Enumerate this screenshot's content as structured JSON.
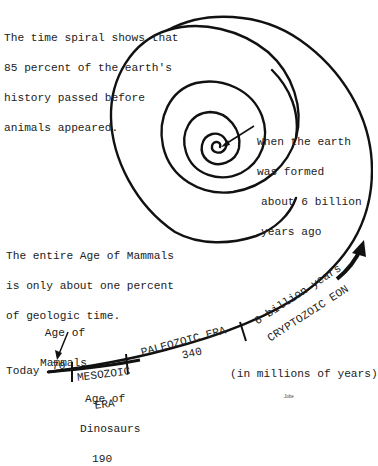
{
  "diagram": {
    "intro_text": [
      "The time spiral shows that",
      "85 percent of the earth's",
      "history passed before",
      "animals appeared."
    ],
    "origin_callout": [
      "When the earth",
      "was formed",
      "about 6 billion",
      "years ago"
    ],
    "mammal_note": [
      "The entire Age of Mammals",
      "is only about one percent",
      "of geologic time."
    ],
    "age_of_mammals_label": [
      "Age of",
      "Mammals"
    ],
    "today_label": "Today",
    "units_label": "(in millions of years)",
    "signature": "Jobe",
    "segments": [
      {
        "name": "Age of Mammals",
        "value": "70"
      },
      {
        "name": "MESOZOIC ERA",
        "line1": "MESOZOIC",
        "line2": "ERA",
        "sublabel": [
          "Age of",
          "Dinosaurs"
        ],
        "value": "190"
      },
      {
        "name": "PALEOZOIC ERA",
        "label": "PALEOZOIC ERA",
        "value": "340"
      },
      {
        "name": "CRYPTOZOIC EON",
        "label": "CRYPTOZOIC EON",
        "span": "6 billion years"
      }
    ],
    "line_color": "#111111",
    "text_color": "#222222"
  }
}
